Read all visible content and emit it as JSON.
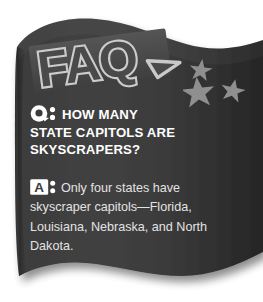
{
  "card": {
    "title": "FAQ",
    "logo_text": "FAQ",
    "decoration": {
      "stars_icon": "three-stars",
      "star_count": 3,
      "star_color": "#8f8f8f"
    },
    "colors": {
      "banner_dark": "#3b3b3b",
      "banner_edge_dark": "#262626",
      "logo_outline": "#c9c9c9",
      "logo_fill": "#4a4a4a",
      "question_text": "#ffffff",
      "answer_text": "#e3e3e3",
      "badge_fill": "#ffffff",
      "page_background": "#ffffff"
    }
  },
  "question": {
    "badge_label": "Q:",
    "badge_icon": "question-bubble-icon",
    "lines": [
      "HOW MANY",
      "STATE CAPITOLS ARE",
      "SKYSCRAPERS?"
    ],
    "full_text": "HOW MANY STATE CAPITOLS ARE SKYSCRAPERS?"
  },
  "answer": {
    "badge_label": "A:",
    "badge_icon": "answer-box-icon",
    "text": "Only four states have skyscraper capitols—Florida, Louisiana, Nebraska, and North Dakota.",
    "states": [
      "Florida",
      "Louisiana",
      "Nebraska",
      "North Dakota"
    ],
    "state_count": 4
  }
}
